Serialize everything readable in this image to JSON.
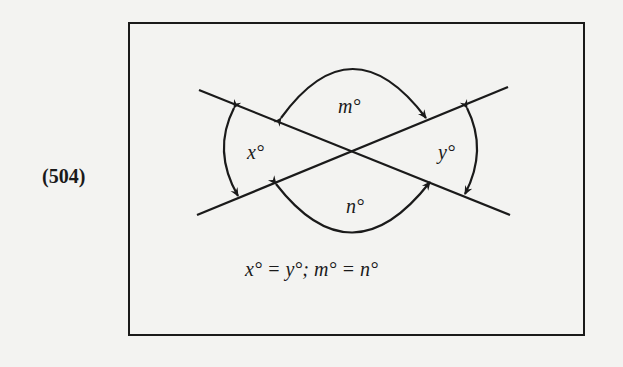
{
  "figure": {
    "number_label": "(504)",
    "angle_labels": {
      "x": "x°",
      "y": "y°",
      "m": "m°",
      "n": "n°"
    },
    "caption_equation": "x° = y°; m° = n°",
    "colors": {
      "ink": "#1a1a1a",
      "background": "#f3f3f1"
    }
  }
}
